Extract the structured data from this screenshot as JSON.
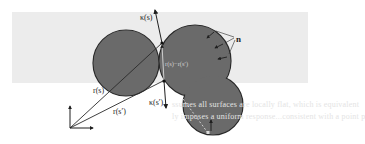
{
  "figure": {
    "colors": {
      "page_bg": "#ffffff",
      "panel_bg": "#ececec",
      "shape_fill": "#6a6a6a",
      "shape_stroke": "#2a2a2a",
      "line": "#2a2a2a",
      "inner_line": "#d8d8d8"
    },
    "labels": {
      "kappa_s": "κ(s)",
      "kappa_s_prime": "κ(s′)",
      "r_s": "r(s)",
      "r_s_prime": "r(s′)",
      "difference": "r(s)−r(s′)",
      "normal": "n"
    },
    "bleed_through_text": {
      "line1": "ssumes all surfaces are locally flat, which is equivalent",
      "line2": "ly imposes a uniform response...consistent with a point p"
    }
  }
}
